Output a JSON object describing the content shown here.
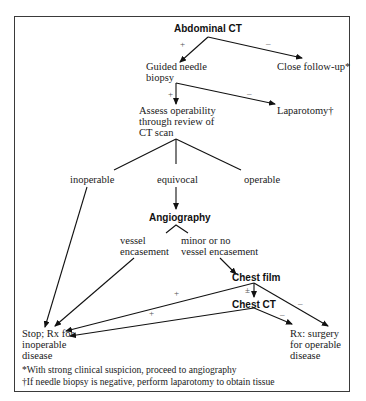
{
  "nodes": {
    "abdominal_ct": "Abdominal CT",
    "guided_biopsy": [
      "Guided needle",
      "biopsy"
    ],
    "close_followup": "Close follow-up*",
    "assess": [
      "Assess operability",
      "through review of",
      "CT scan"
    ],
    "laparotomy": "Laparotomy†",
    "inoperable": "inoperable",
    "equivocal": "equivocal",
    "operable": "operable",
    "angiography": "Angiography",
    "vessel_encasement": [
      "vessel",
      "encasement"
    ],
    "minor_encasement": [
      "minor or no",
      "vessel encasement"
    ],
    "chest_film": "Chest film",
    "chest_ct": "Chest CT",
    "stop": [
      "Stop; Rx for",
      "inoperable",
      "disease"
    ],
    "surgery": [
      "Rx: surgery",
      "for operable",
      "disease"
    ]
  },
  "edge_labels": {
    "ct_pos": "+",
    "ct_neg": "–",
    "biopsy_pos": "+",
    "biopsy_neg": "–",
    "film_pos": "+",
    "film_equivocal": "±",
    "film_neg": "–",
    "chestct_pos": "+",
    "chestct_neg": "–"
  },
  "footnotes": [
    "*With strong clinical suspicion, proceed to angiography",
    "†If needle biopsy is negative, perform laparotomy to obtain tissue"
  ]
}
